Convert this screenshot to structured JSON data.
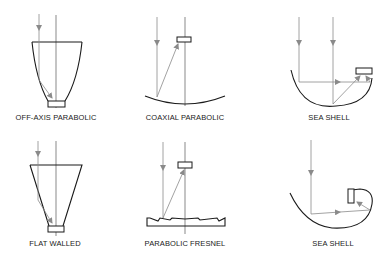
{
  "diagram": {
    "panels": [
      {
        "id": "off-axis-parabolic",
        "label": "OFF-AXIS PARABOLIC"
      },
      {
        "id": "coaxial-parabolic",
        "label": "COAXIAL PARABOLIC"
      },
      {
        "id": "sea-shell-1",
        "label": "SEA SHELL"
      },
      {
        "id": "flat-walled",
        "label": "FLAT WALLED"
      },
      {
        "id": "parabolic-fresnel",
        "label": "PARABOLIC FRESNEL"
      },
      {
        "id": "sea-shell-2",
        "label": "SEA SHELL"
      }
    ],
    "colors": {
      "outline": "#1a1a1a",
      "ray": "#8a8a8a",
      "background": "#ffffff"
    }
  }
}
